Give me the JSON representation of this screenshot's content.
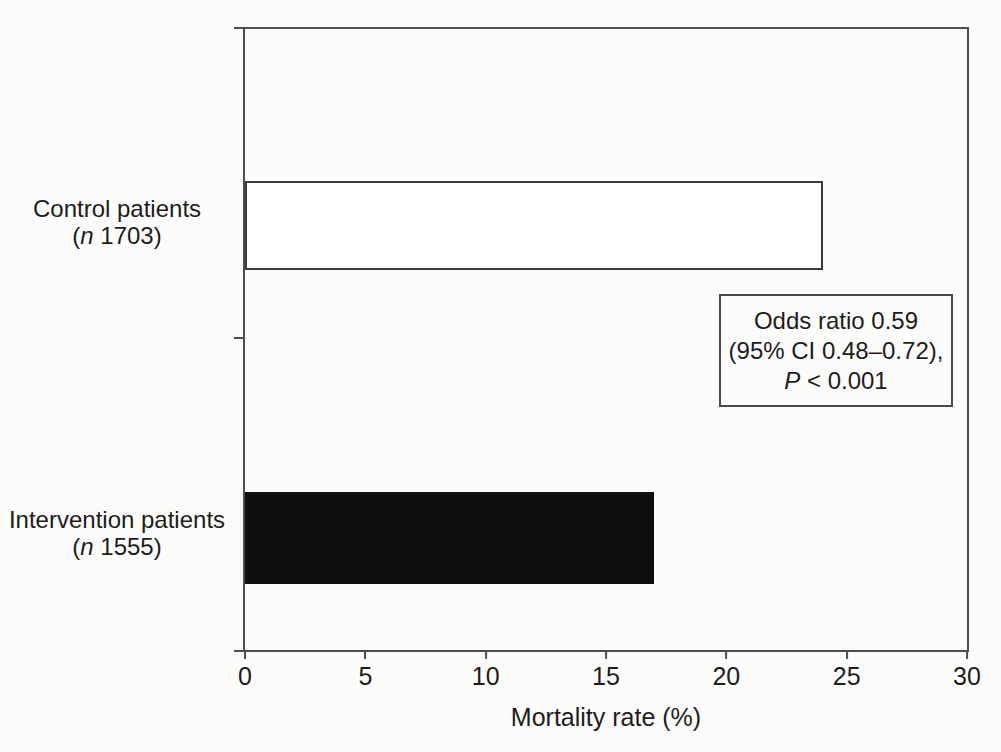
{
  "figure": {
    "background": "#fcfcfb",
    "line_color": "#4d4d4d",
    "text_color": "#1c1c1c"
  },
  "chart_data": {
    "type": "bar",
    "orientation": "horizontal",
    "title": "",
    "xlabel": "Mortality rate (%)",
    "ylabel": "",
    "xlim": [
      0,
      30
    ],
    "x_ticks": [
      0,
      5,
      10,
      15,
      20,
      25,
      30
    ],
    "grid": false,
    "legend": "none",
    "categories": [
      "Control patients (n 1703)",
      "Intervention patients (n 1555)"
    ],
    "values": [
      24,
      17
    ],
    "bars": [
      {
        "label_line1": "Control patients",
        "sub_prefix": "(",
        "sub_italic": "n",
        "sub_rest": " 1703)",
        "value": 24,
        "fill": "#ffffff",
        "border": "#3a3a3a"
      },
      {
        "label_line1": "Intervention patients",
        "sub_prefix": "(",
        "sub_italic": "n",
        "sub_rest": " 1555)",
        "value": 17,
        "fill": "#0f0f0f",
        "border": "#0f0f0f"
      }
    ],
    "annotation": {
      "line1": "Odds ratio 0.59",
      "line2": "(95% CI 0.48–0.72),",
      "line3_italic": "P",
      "line3_rest": " < 0.001"
    }
  }
}
